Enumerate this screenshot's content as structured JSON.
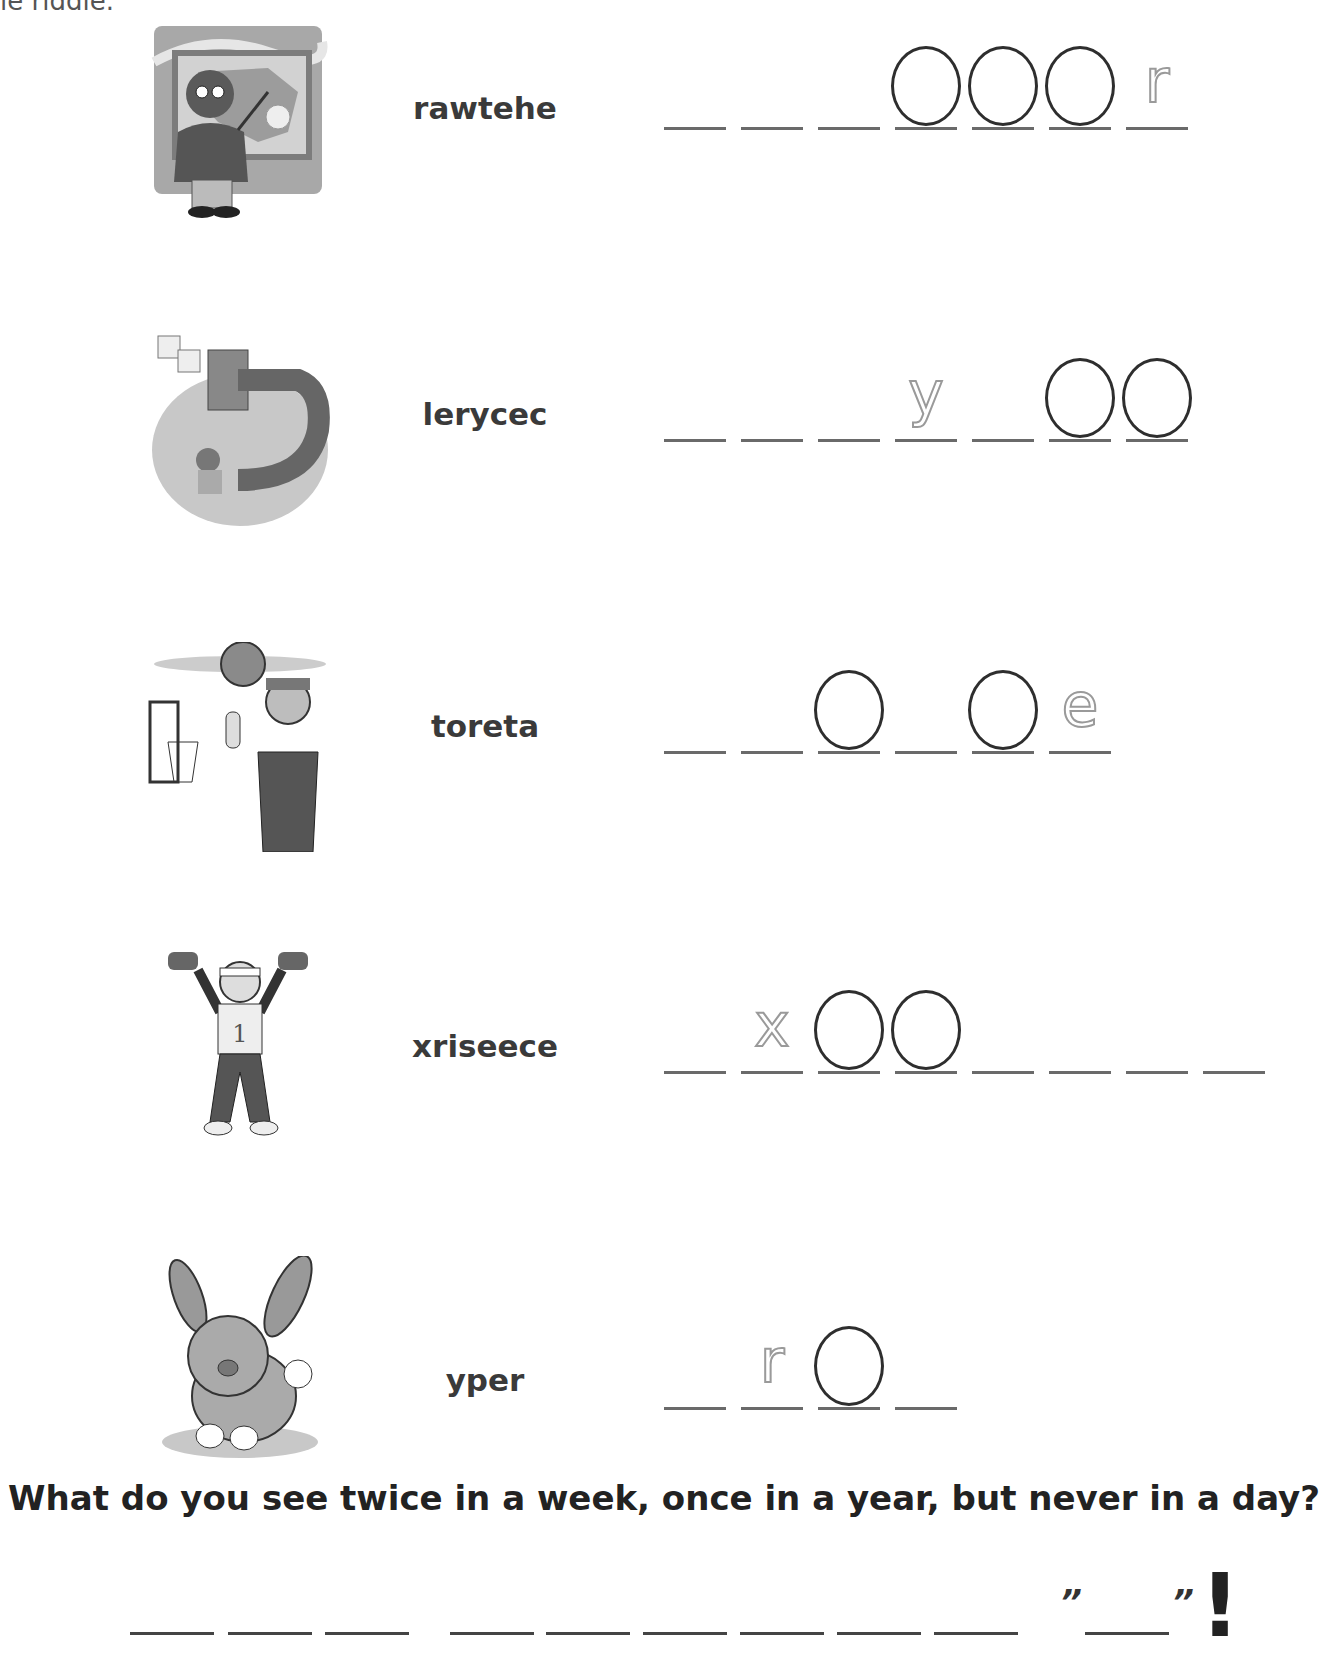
{
  "header": {
    "cut_text": "le riddle."
  },
  "rows": [
    {
      "picture": "weatherman-illustration",
      "scrambled": "rawtehe",
      "slots": [
        {
          "type": "blank"
        },
        {
          "type": "blank"
        },
        {
          "type": "blank"
        },
        {
          "type": "circle"
        },
        {
          "type": "circle"
        },
        {
          "type": "circle"
        },
        {
          "type": "hint",
          "letter": "r"
        }
      ]
    },
    {
      "picture": "recycling-illustration",
      "scrambled": "lerycec",
      "slots": [
        {
          "type": "blank"
        },
        {
          "type": "blank"
        },
        {
          "type": "blank"
        },
        {
          "type": "hint",
          "letter": "y"
        },
        {
          "type": "blank"
        },
        {
          "type": "circle"
        },
        {
          "type": "circle"
        }
      ]
    },
    {
      "picture": "basketball-player-illustration",
      "scrambled": "toreta",
      "slots": [
        {
          "type": "blank"
        },
        {
          "type": "blank"
        },
        {
          "type": "circle"
        },
        {
          "type": "blank"
        },
        {
          "type": "circle"
        },
        {
          "type": "hint",
          "letter": "e"
        }
      ]
    },
    {
      "picture": "weightlifter-illustration",
      "scrambled": "xriseece",
      "slots": [
        {
          "type": "blank"
        },
        {
          "type": "hint",
          "letter": "x"
        },
        {
          "type": "circle"
        },
        {
          "type": "circle"
        },
        {
          "type": "blank"
        },
        {
          "type": "blank"
        },
        {
          "type": "blank"
        },
        {
          "type": "blank"
        }
      ]
    },
    {
      "picture": "rabbit-illustration",
      "scrambled": "yper",
      "slots": [
        {
          "type": "blank"
        },
        {
          "type": "hint",
          "letter": "r"
        },
        {
          "type": "circle"
        },
        {
          "type": "blank"
        }
      ]
    }
  ],
  "riddle": {
    "question": "What do you see twice in a week, once in a year, but never in a day?",
    "answer_groups": [
      3,
      6
    ],
    "quoted_blank_count": 1,
    "open_quote": "”",
    "close_quote": "”",
    "exclamation": "!"
  }
}
